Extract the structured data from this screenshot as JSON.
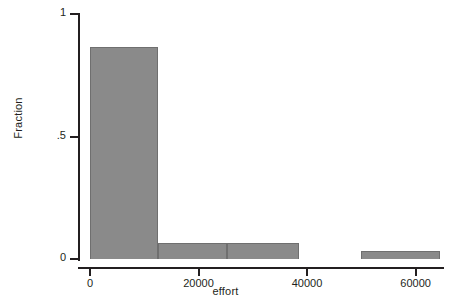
{
  "chart_data": {
    "type": "bar",
    "title": "",
    "subtitle": "",
    "xlabel": "effort",
    "ylabel": "Fraction",
    "xlim": [
      0,
      64500
    ],
    "ylim": [
      0,
      1
    ],
    "grid": false,
    "legend": null,
    "xticks": [
      {
        "value": 0,
        "label": "0"
      },
      {
        "value": 20000,
        "label": "20000"
      },
      {
        "value": 40000,
        "label": "40000"
      },
      {
        "value": 60000,
        "label": "60000"
      }
    ],
    "yticks": [
      {
        "value": 0,
        "label": "0"
      },
      {
        "value": 0.5,
        "label": ".5"
      },
      {
        "value": 1,
        "label": "1"
      }
    ],
    "bar_color": "#8a8a8a",
    "axis_color": "#231f20",
    "bins": [
      {
        "x0": 0,
        "x1": 12500,
        "value": 0.865
      },
      {
        "x0": 12500,
        "x1": 25200,
        "value": 0.065
      },
      {
        "x0": 25200,
        "x1": 38500,
        "value": 0.065
      },
      {
        "x0": 50000,
        "x1": 64500,
        "value": 0.033
      }
    ],
    "categories": [
      "0-12500",
      "12500-25200",
      "25200-38500",
      "50000-64500"
    ],
    "values": [
      0.865,
      0.065,
      0.065,
      0.033
    ]
  }
}
